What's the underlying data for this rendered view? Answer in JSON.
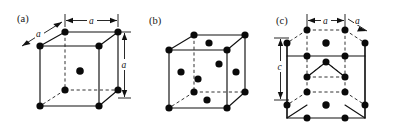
{
  "figure": {
    "background_color": "#ffffff",
    "ink_color": "#111111",
    "atom_color": "#0a0a0a",
    "width": 393,
    "height": 126
  },
  "panels": [
    {
      "key": "a",
      "label": "(a)",
      "structure": "body-centered cubic",
      "dimensions": [
        {
          "name": "top-edge-a",
          "label": "a",
          "orientation": "horizontal"
        },
        {
          "name": "depth-a",
          "label": "a",
          "orientation": "diagonal"
        },
        {
          "name": "right-edge-a",
          "label": "a",
          "orientation": "vertical"
        }
      ],
      "atom_count": 9,
      "atoms": [
        {
          "name": "corner-front-top-left"
        },
        {
          "name": "corner-front-top-right"
        },
        {
          "name": "corner-front-bottom-left"
        },
        {
          "name": "corner-front-bottom-right"
        },
        {
          "name": "corner-back-top-left"
        },
        {
          "name": "corner-back-top-right"
        },
        {
          "name": "corner-back-bottom-left"
        },
        {
          "name": "corner-back-bottom-right"
        },
        {
          "name": "body-center"
        }
      ]
    },
    {
      "key": "b",
      "label": "(b)",
      "structure": "face-centered cubic",
      "dimensions": [],
      "atom_count": 14,
      "atoms": [
        {
          "name": "corner-front-top-left"
        },
        {
          "name": "corner-front-top-right"
        },
        {
          "name": "corner-front-bottom-left"
        },
        {
          "name": "corner-front-bottom-right"
        },
        {
          "name": "corner-back-top-left"
        },
        {
          "name": "corner-back-top-right"
        },
        {
          "name": "corner-back-bottom-left"
        },
        {
          "name": "corner-back-bottom-right"
        },
        {
          "name": "face-center-front"
        },
        {
          "name": "face-center-back"
        },
        {
          "name": "face-center-top"
        },
        {
          "name": "face-center-bottom"
        },
        {
          "name": "face-center-left"
        },
        {
          "name": "face-center-right"
        }
      ]
    },
    {
      "key": "c",
      "label": "(c)",
      "structure": "hexagonal close-packed",
      "dimensions": [
        {
          "name": "top-span-a",
          "label": "a",
          "orientation": "horizontal"
        },
        {
          "name": "top-edge-a",
          "label": "a",
          "orientation": "diagonal"
        },
        {
          "name": "height-c",
          "label": "c",
          "orientation": "vertical"
        }
      ],
      "atom_count": 17,
      "atoms": [
        {
          "name": "top-hex-vertex-1"
        },
        {
          "name": "top-hex-vertex-2"
        },
        {
          "name": "top-hex-vertex-3"
        },
        {
          "name": "top-hex-vertex-4"
        },
        {
          "name": "top-hex-vertex-5"
        },
        {
          "name": "top-hex-vertex-6"
        },
        {
          "name": "top-hex-center"
        },
        {
          "name": "bottom-hex-vertex-1"
        },
        {
          "name": "bottom-hex-vertex-2"
        },
        {
          "name": "bottom-hex-vertex-3"
        },
        {
          "name": "bottom-hex-vertex-4"
        },
        {
          "name": "bottom-hex-vertex-5"
        },
        {
          "name": "bottom-hex-vertex-6"
        },
        {
          "name": "bottom-hex-center"
        },
        {
          "name": "mid-plane-atom-1"
        },
        {
          "name": "mid-plane-atom-2"
        },
        {
          "name": "mid-plane-atom-3"
        }
      ]
    }
  ]
}
